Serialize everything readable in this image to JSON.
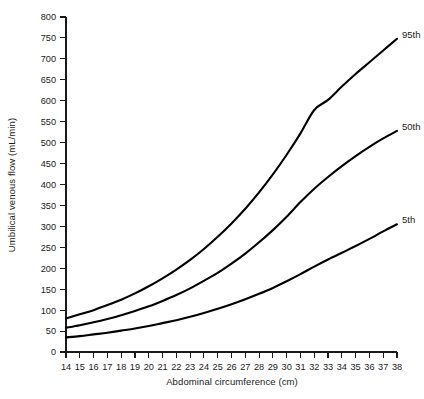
{
  "chart_data": {
    "type": "line",
    "title": "",
    "xlabel": "Abdominal circumference (cm)",
    "ylabel": "Umbilical venous flow (mL/min)",
    "xlim": [
      14,
      38
    ],
    "ylim": [
      0,
      800
    ],
    "grid": false,
    "legend_position": "inline-right-end",
    "xticks": [
      14,
      15,
      16,
      17,
      18,
      19,
      20,
      21,
      22,
      23,
      24,
      25,
      26,
      27,
      28,
      29,
      30,
      31,
      32,
      33,
      34,
      35,
      36,
      37,
      38
    ],
    "yticks": [
      0,
      50,
      100,
      150,
      200,
      250,
      300,
      350,
      400,
      450,
      500,
      550,
      600,
      650,
      700,
      750,
      800
    ],
    "x": [
      14,
      15,
      16,
      17,
      18,
      19,
      20,
      21,
      22,
      23,
      24,
      25,
      26,
      27,
      28,
      29,
      30,
      31,
      32,
      33,
      34,
      35,
      36,
      37,
      38
    ],
    "series": [
      {
        "name": "95th",
        "label": "95th",
        "color": "#000000",
        "values": [
          80,
          90,
          100,
          112,
          125,
          140,
          157,
          176,
          197,
          220,
          246,
          275,
          307,
          342,
          381,
          424,
          471,
          522,
          578,
          602,
          634,
          664,
          692,
          720,
          748
        ]
      },
      {
        "name": "50th",
        "label": "50th",
        "color": "#000000",
        "values": [
          58,
          64,
          71,
          79,
          88,
          98,
          109,
          122,
          136,
          152,
          170,
          189,
          211,
          235,
          262,
          291,
          323,
          358,
          390,
          418,
          444,
          468,
          490,
          510,
          528
        ]
      },
      {
        "name": "5th",
        "label": "5th",
        "color": "#000000",
        "values": [
          35,
          38,
          42,
          46,
          51,
          56,
          62,
          69,
          76,
          84,
          93,
          103,
          114,
          126,
          139,
          153,
          169,
          186,
          204,
          221,
          237,
          253,
          270,
          288,
          305
        ]
      }
    ]
  },
  "axes": {
    "y_title": "Umbilical venous flow (mL/min)",
    "x_title": "Abdominal circumference (cm)"
  },
  "labels": {
    "p95": "95th",
    "p50": "50th",
    "p5": "5th"
  }
}
